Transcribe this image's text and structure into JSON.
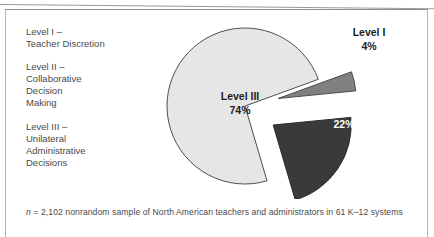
{
  "figure": {
    "caption_italic": "n",
    "caption_rest": " = 2,102 nonrandom sample of North American teachers and administrators in 61 K–12 systems"
  },
  "legend": {
    "items": [
      {
        "name": "legend-level-1",
        "text": "Level I –\nTeacher Discretion"
      },
      {
        "name": "legend-level-2",
        "text": "Level II –\nCollaborative\nDecision\nMaking"
      },
      {
        "name": "legend-level-3",
        "text": "Level III –\nUnilateral\nAdministrative\nDecisions"
      }
    ]
  },
  "chart_data": {
    "type": "pie",
    "title": "",
    "subtitle": "",
    "xlabel": "",
    "ylabel": "",
    "legend_position": "left",
    "grid": false,
    "units": "percent",
    "start_angle_deg": -20,
    "direction": "clockwise",
    "categories": [
      "Level I",
      "Level II",
      "Level III"
    ],
    "values": [
      4,
      22,
      74
    ],
    "slices": [
      {
        "name": "Level I",
        "value": 4,
        "value_label": "4%",
        "name_label": "Level I",
        "color": "#808080",
        "label_color": "#1d1d1d",
        "label_placement": "outside",
        "exploded": true
      },
      {
        "name": "Level II",
        "value": 22,
        "value_label": "22%",
        "name_label": "Level II",
        "color": "#3a3a3a",
        "label_color": "#ffffff",
        "label_placement": "inside",
        "exploded": true
      },
      {
        "name": "Level III",
        "value": 74,
        "value_label": "74%",
        "name_label": "Level III",
        "color": "#e6e6e6",
        "label_color": "#1d1d1d",
        "label_placement": "inside",
        "exploded": false
      }
    ],
    "stroke_color": "#4d4d4d",
    "background": "#ffffff"
  }
}
